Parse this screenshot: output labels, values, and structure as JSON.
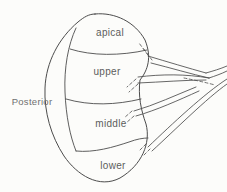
{
  "figure": {
    "kind": "anatomical-line-diagram",
    "labels": {
      "posterior": "Posterior",
      "apical": "apical",
      "upper": "upper",
      "middle": "middle",
      "lower": "lower"
    },
    "colors": {
      "background": "#fcfcfa",
      "line": "#4c4c4c",
      "label": "#5c5c5c",
      "posterior_label": "#707070"
    }
  }
}
